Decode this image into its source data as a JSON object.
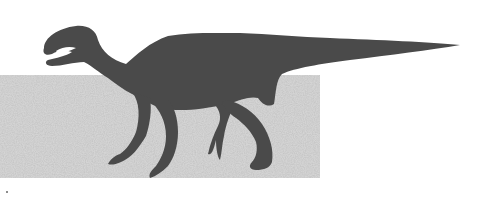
{
  "illustration": {
    "subject": "dinosaur-silhouette",
    "description": "Dark gray silhouette of a bipedal/quadrupedal ornithopod dinosaur walking left over a grainy gray textured rectangle",
    "colors": {
      "background": "#ffffff",
      "silhouette": "#4a4a4a",
      "texture_base": "#d2d2d2",
      "texture_dark": "#9a9a9a"
    },
    "texture_block": {
      "x": 0,
      "y": 75,
      "width": 320,
      "height": 103
    },
    "tail_tip": {
      "x": 460,
      "y": 45
    }
  }
}
